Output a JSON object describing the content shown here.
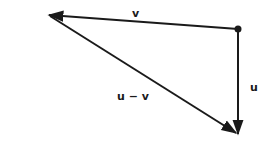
{
  "diagram": {
    "colors": {
      "stroke": "#1a1a1a",
      "background": "#ffffff"
    },
    "vectors": [
      {
        "id": "v",
        "label": "v",
        "from": "origin-point",
        "to": "left-point"
      },
      {
        "id": "u",
        "label": "u",
        "from": "origin-point",
        "to": "bottom-point"
      },
      {
        "id": "u-minus-v",
        "label": "u − v",
        "from": "left-point",
        "to": "bottom-point"
      }
    ]
  }
}
